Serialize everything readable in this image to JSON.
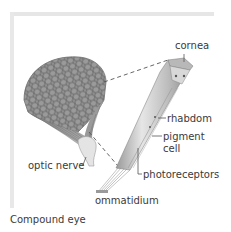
{
  "figure": {
    "caption": "Compound eye",
    "labels": {
      "cornea": "cornea",
      "rhabdom": "rhabdom",
      "pigment_cell_line1": "pigment",
      "pigment_cell_line2": "cell",
      "optic_nerve": "optic nerve",
      "photoreceptors": "photoreceptors",
      "ommatidium": "ommatidium"
    },
    "colors": {
      "eye_surface": "#8a8a8a",
      "facet_lines": "#5e5e5e",
      "ommatidium_body": "#cfcfcf",
      "label_text": "#3a3a3a",
      "leader_lines": "#555555"
    }
  }
}
